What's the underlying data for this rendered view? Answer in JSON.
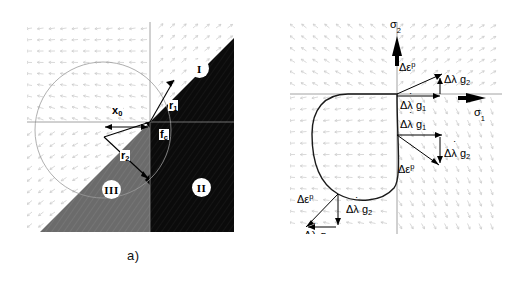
{
  "figure": {
    "panels": [
      {
        "id": "a",
        "caption": "a)",
        "description": "Multisurface yield criterion in principal stress plane with three regions and return-mapping radii",
        "labels": {
          "x0": "x",
          "x0_sub": "0",
          "r1": "r",
          "r1_sub": "1",
          "r2": "r",
          "r2_sub": "2",
          "fc": "f",
          "fc_sub": "c"
        },
        "regions": [
          {
            "name": "region-one",
            "roman": "I",
            "fill": "#0d0d0d"
          },
          {
            "name": "region-two",
            "roman": "II",
            "fill": "#080808"
          },
          {
            "name": "region-three",
            "roman": "III",
            "fill": "#6b6b6b"
          }
        ]
      },
      {
        "id": "b",
        "caption": "b)",
        "description": "Yield surface with plastic strain increment decomposition into gradient contributions",
        "axes": {
          "vertical": "σ",
          "vertical_sub": "2",
          "horizontal": "σ",
          "horizontal_sub": "1"
        },
        "annotations": [
          {
            "name": "corner-top-deps",
            "text": "Δε",
            "sup": "p"
          },
          {
            "name": "corner-top-dlg2",
            "text": "Δλ g",
            "sub": "2"
          },
          {
            "name": "corner-top-dlg1",
            "text": "Δλ g",
            "sub": "1",
            "dot": true
          },
          {
            "name": "corner-mid-dlg1",
            "text": "Δλ g",
            "sub": "1",
            "dot": true
          },
          {
            "name": "corner-mid-dlg2",
            "text": "Δλ g",
            "sub": "2",
            "dot": true
          },
          {
            "name": "corner-mid-deps",
            "text": "Δε",
            "sup": "p"
          },
          {
            "name": "corner-low-deps",
            "text": "Δε",
            "sup": "p"
          },
          {
            "name": "corner-low-dlg2",
            "text": "Δλ g",
            "sub": "2",
            "dot": true
          },
          {
            "name": "corner-low-dlg1",
            "text": "Δλ g",
            "sub": "1",
            "dot": true
          }
        ]
      }
    ],
    "colors": {
      "background": "#ffffff",
      "dark_region": "#0d0d0d",
      "gray_region": "#6b6b6b",
      "vector_field": "#c8c8c8",
      "curve": "#1a1a1a",
      "axis": "#000000"
    }
  }
}
